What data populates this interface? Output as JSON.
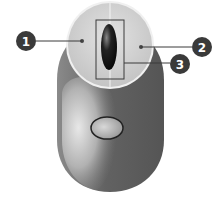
{
  "diagram": {
    "colors": {
      "body": "#5f5f5f",
      "body_highlight": "#c8c8c8",
      "button_disc": "#d6d6d6",
      "wheel": "#111111",
      "callout": "#3a3a3a",
      "background": "#ffffff"
    },
    "callouts": [
      {
        "number": "1",
        "target": "left button"
      },
      {
        "number": "2",
        "target": "right button"
      },
      {
        "number": "3",
        "target": "scroll wheel"
      }
    ]
  }
}
